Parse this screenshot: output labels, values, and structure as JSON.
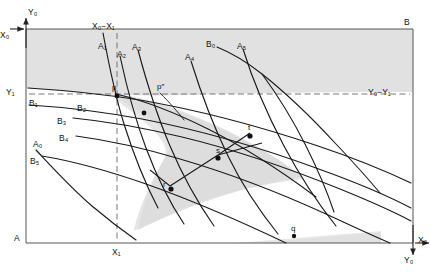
{
  "figure": {
    "type": "edgeworth-box-diagram",
    "corners": {
      "bottom_left": "A",
      "top_right": "B"
    },
    "axis_labels": {
      "top_left_y": "Y₀",
      "top_left_x": "X₀",
      "left_y1": "Y₁",
      "top_mid": "X₀−X₁",
      "bottom_mid": "X₁",
      "right_mid": "Y₀−Y₁",
      "bottom_right_x": "X₀",
      "bottom_right_y": "Y₀"
    },
    "curve_labels_a": [
      {
        "name": "A₀",
        "x": 33,
        "y": 140
      },
      {
        "name": "A₁",
        "x": 98,
        "y": 42
      },
      {
        "name": "A₂",
        "x": 117,
        "y": 50
      },
      {
        "name": "A₃",
        "x": 132,
        "y": 43
      },
      {
        "name": "A₄",
        "x": 185,
        "y": 53
      },
      {
        "name": "A₅",
        "x": 237,
        "y": 42
      }
    ],
    "curve_labels_b": [
      {
        "name": "B₀",
        "x": 206,
        "y": 40
      },
      {
        "name": "B₁",
        "x": 29,
        "y": 99
      },
      {
        "name": "B₂",
        "x": 77,
        "y": 104
      },
      {
        "name": "B₃",
        "x": 57,
        "y": 117
      },
      {
        "name": "B₄",
        "x": 59,
        "y": 134
      },
      {
        "name": "B₅",
        "x": 30,
        "y": 157
      }
    ],
    "points": [
      {
        "name": "p",
        "label": "p",
        "x": 116,
        "y": 94
      },
      {
        "name": "p-double-prime",
        "label": "p″",
        "x": 160,
        "y": 93
      },
      {
        "name": "t",
        "label": "t",
        "x": 250,
        "y": 133
      },
      {
        "name": "s",
        "label": "s",
        "x": 218,
        "y": 155
      },
      {
        "name": "r",
        "label": "r",
        "x": 170,
        "y": 186
      },
      {
        "name": "q",
        "label": "q",
        "x": 293,
        "y": 232
      }
    ],
    "colors": {
      "line": "#1a1a1a",
      "shade": "#d9d9d9",
      "shade_light": "#e4e4e4",
      "frame": "#555555",
      "dashed": "#666666"
    }
  }
}
